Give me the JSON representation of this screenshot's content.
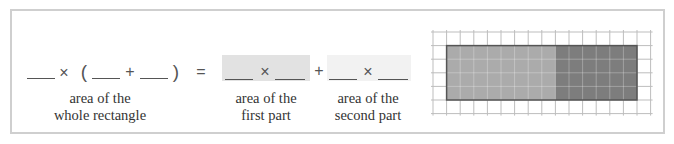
{
  "equation": {
    "whole": {
      "blanks": [
        "",
        "",
        ""
      ],
      "times": "×",
      "open_paren": "(",
      "plus": "+",
      "close_paren": ")",
      "label_line1": "area of the",
      "label_line2": "whole rectangle"
    },
    "equals": "=",
    "first_part": {
      "blanks": [
        "",
        ""
      ],
      "times": "×",
      "label_line1": "area of the",
      "label_line2": "first part",
      "shade_color": "#e2e2e2"
    },
    "plus": "+",
    "second_part": {
      "blanks": [
        "",
        ""
      ],
      "times": "×",
      "label_line1": "area of the",
      "label_line2": "second part",
      "shade_color": "#f2f2f2"
    }
  },
  "grid_figure": {
    "grid_columns": 16,
    "grid_rows": 6,
    "cell_size_px": 13.6,
    "rectangle": {
      "width_units": 14,
      "height_units": 4,
      "border_color": "#555555"
    },
    "first_part": {
      "width_units": 8,
      "height_units": 4,
      "color": "#ababab"
    },
    "second_part": {
      "width_units": 6,
      "height_units": 4,
      "color": "#7d7d7d"
    },
    "grid_line_color": "#bdbdbd"
  }
}
